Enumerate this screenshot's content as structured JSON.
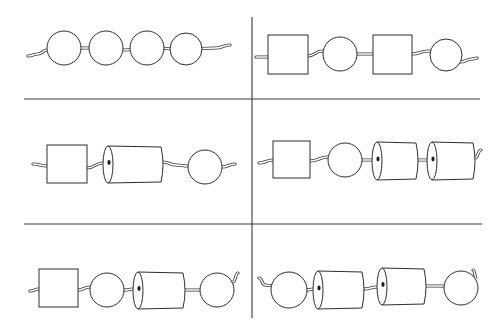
{
  "figure": {
    "colors": {
      "line": "#3a3a3a",
      "bead_fill": "#ffffff",
      "background": "#ffffff"
    },
    "grid": {
      "vertical_divider": {
        "x": 252,
        "y1": 17,
        "y2": 318
      },
      "horizontal_dividers": [
        {
          "y": 99,
          "x1": 24,
          "x2": 480
        },
        {
          "y": 224,
          "x1": 24,
          "x2": 482
        }
      ]
    },
    "panels": [
      {
        "id": "top-left",
        "sequence": [
          "circle",
          "circle",
          "circle",
          "circle"
        ],
        "string": [
          [
            28,
            56
          ],
          [
            38,
            54
          ],
          [
            47,
            50
          ],
          [
            64,
            48
          ],
          [
            106,
            48
          ],
          [
            124,
            50
          ],
          [
            147,
            48
          ],
          [
            186,
            49
          ],
          [
            216,
            48
          ],
          [
            230,
            45
          ]
        ],
        "beads": [
          {
            "shape": "circle",
            "cx": 64,
            "cy": 48,
            "r": 17
          },
          {
            "shape": "circle",
            "cx": 106,
            "cy": 48,
            "r": 17
          },
          {
            "shape": "circle",
            "cx": 147,
            "cy": 48,
            "r": 17
          },
          {
            "shape": "circle",
            "cx": 186,
            "cy": 49,
            "r": 16
          }
        ]
      },
      {
        "id": "top-right",
        "sequence": [
          "square",
          "circle",
          "square",
          "circle"
        ],
        "string": [
          [
            256,
            57
          ],
          [
            268,
            57
          ],
          [
            308,
            56
          ],
          [
            322,
            51
          ],
          [
            340,
            54
          ],
          [
            358,
            54
          ],
          [
            373,
            54
          ],
          [
            412,
            54
          ],
          [
            428,
            51
          ],
          [
            446,
            55
          ],
          [
            460,
            62
          ],
          [
            472,
            59
          ],
          [
            477,
            58
          ]
        ],
        "beads": [
          {
            "shape": "square",
            "x": 268,
            "y": 35,
            "w": 40,
            "h": 39
          },
          {
            "shape": "circle",
            "cx": 340,
            "cy": 54,
            "r": 17
          },
          {
            "shape": "square",
            "x": 373,
            "y": 35,
            "w": 39,
            "h": 39
          },
          {
            "shape": "circle",
            "cx": 446,
            "cy": 55,
            "r": 16
          }
        ]
      },
      {
        "id": "middle-left",
        "sequence": [
          "square",
          "cylinder",
          "circle"
        ],
        "string": [
          [
            33,
            164
          ],
          [
            47,
            166
          ],
          [
            87,
            168
          ],
          [
            103,
            163
          ],
          [
            163,
            162
          ],
          [
            176,
            165
          ],
          [
            188,
            166
          ],
          [
            205,
            167
          ],
          [
            222,
            167
          ],
          [
            235,
            164
          ]
        ],
        "beads": [
          {
            "shape": "square",
            "x": 47,
            "y": 145,
            "w": 40,
            "h": 38
          },
          {
            "shape": "cylinder",
            "x": 103,
            "y": 146,
            "w": 60,
            "h": 37
          },
          {
            "shape": "circle",
            "cx": 205,
            "cy": 167,
            "r": 17
          }
        ]
      },
      {
        "id": "middle-right",
        "sequence": [
          "square",
          "circle",
          "cylinder",
          "cylinder"
        ],
        "string": [
          [
            259,
            163
          ],
          [
            273,
            160
          ],
          [
            310,
            161
          ],
          [
            328,
            157
          ],
          [
            345,
            160
          ],
          [
            364,
            160
          ],
          [
            372,
            160
          ],
          [
            418,
            160
          ],
          [
            427,
            160
          ],
          [
            475,
            158
          ],
          [
            481,
            150
          ]
        ],
        "beads": [
          {
            "shape": "square",
            "x": 273,
            "y": 141,
            "w": 37,
            "h": 37
          },
          {
            "shape": "circle",
            "cx": 345,
            "cy": 160,
            "r": 17
          },
          {
            "shape": "cylinder",
            "x": 372,
            "y": 142,
            "w": 46,
            "h": 38
          },
          {
            "shape": "cylinder",
            "x": 427,
            "y": 142,
            "w": 48,
            "h": 38
          }
        ]
      },
      {
        "id": "bottom-left",
        "sequence": [
          "square",
          "circle",
          "cylinder",
          "circle"
        ],
        "string": [
          [
            30,
            291
          ],
          [
            39,
            289
          ],
          [
            78,
            290
          ],
          [
            90,
            287
          ],
          [
            107,
            290
          ],
          [
            125,
            290
          ],
          [
            133,
            289
          ],
          [
            185,
            290
          ],
          [
            200,
            290
          ],
          [
            217,
            290
          ],
          [
            233,
            282
          ],
          [
            238,
            273
          ]
        ],
        "beads": [
          {
            "shape": "square",
            "x": 39,
            "y": 269,
            "w": 39,
            "h": 38
          },
          {
            "shape": "circle",
            "cx": 107,
            "cy": 290,
            "r": 17
          },
          {
            "shape": "cylinder",
            "x": 133,
            "y": 272,
            "w": 52,
            "h": 37
          },
          {
            "shape": "circle",
            "cx": 217,
            "cy": 290,
            "r": 17
          }
        ]
      },
      {
        "id": "bottom-right",
        "sequence": [
          "circle",
          "cylinder",
          "cylinder",
          "circle"
        ],
        "string": [
          [
            259,
            278
          ],
          [
            265,
            285
          ],
          [
            289,
            290
          ],
          [
            307,
            290
          ],
          [
            313,
            289
          ],
          [
            364,
            289
          ],
          [
            377,
            287
          ],
          [
            426,
            286
          ],
          [
            440,
            286
          ],
          [
            461,
            288
          ],
          [
            477,
            280
          ],
          [
            473,
            270
          ]
        ],
        "beads": [
          {
            "shape": "circle",
            "cx": 289,
            "cy": 290,
            "r": 18
          },
          {
            "shape": "cylinder",
            "x": 313,
            "y": 271,
            "w": 51,
            "h": 38
          },
          {
            "shape": "cylinder",
            "x": 377,
            "y": 268,
            "w": 49,
            "h": 37
          },
          {
            "shape": "circle",
            "cx": 461,
            "cy": 288,
            "r": 17
          }
        ]
      }
    ]
  }
}
